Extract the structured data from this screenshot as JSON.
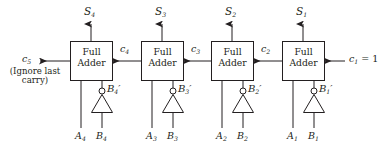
{
  "diagram": {
    "block_label_line1": "Full",
    "block_label_line2": "Adder",
    "note": {
      "line1": "(Ignore last",
      "line2": "carry)"
    },
    "stroke_color": "#231f20",
    "background": "#ffffff"
  },
  "outputs": {
    "sums": [
      {
        "name": "S",
        "sub": "4"
      },
      {
        "name": "S",
        "sub": "3"
      },
      {
        "name": "S",
        "sub": "2"
      },
      {
        "name": "S",
        "sub": "1"
      }
    ],
    "final_carry": {
      "name": "c",
      "sub": "5"
    }
  },
  "carries": [
    {
      "name": "c",
      "sub": "4"
    },
    {
      "name": "c",
      "sub": "3"
    },
    {
      "name": "c",
      "sub": "2"
    }
  ],
  "carry_in": {
    "name": "c",
    "sub": "1",
    "equals": " = 1"
  },
  "stages": [
    {
      "adder_label_1": "Full",
      "adder_label_2": "Adder",
      "inverter_out": {
        "name": "B",
        "sub": "4",
        "prime": "′"
      },
      "input_a": {
        "name": "A",
        "sub": "4"
      },
      "input_b": {
        "name": "B",
        "sub": "4"
      }
    },
    {
      "adder_label_1": "Full",
      "adder_label_2": "Adder",
      "inverter_out": {
        "name": "B",
        "sub": "3",
        "prime": "′"
      },
      "input_a": {
        "name": "A",
        "sub": "3"
      },
      "input_b": {
        "name": "B",
        "sub": "3"
      }
    },
    {
      "adder_label_1": "Full",
      "adder_label_2": "Adder",
      "inverter_out": {
        "name": "B",
        "sub": "2",
        "prime": "′"
      },
      "input_a": {
        "name": "A",
        "sub": "2"
      },
      "input_b": {
        "name": "B",
        "sub": "2"
      }
    },
    {
      "adder_label_1": "Full",
      "adder_label_2": "Adder",
      "inverter_out": {
        "name": "B",
        "sub": "1",
        "prime": "′"
      },
      "input_a": {
        "name": "A",
        "sub": "1"
      },
      "input_b": {
        "name": "B",
        "sub": "1"
      }
    }
  ]
}
